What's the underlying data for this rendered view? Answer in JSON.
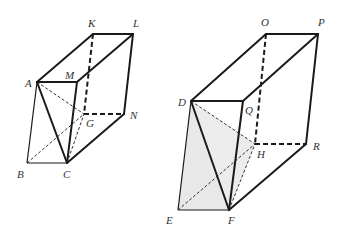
{
  "figures": [
    {
      "name": "prism-left",
      "shaded": false,
      "labels": {
        "K": "K",
        "L": "L",
        "A": "A",
        "M": "M",
        "G": "G",
        "N": "N",
        "B": "B",
        "C": "C"
      }
    },
    {
      "name": "prism-right",
      "shaded": true,
      "shade_color": "#e8e8e8",
      "labels": {
        "O": "O",
        "P": "P",
        "D": "D",
        "Q": "Q",
        "H": "H",
        "R": "R",
        "E": "E",
        "F": "F"
      }
    }
  ]
}
